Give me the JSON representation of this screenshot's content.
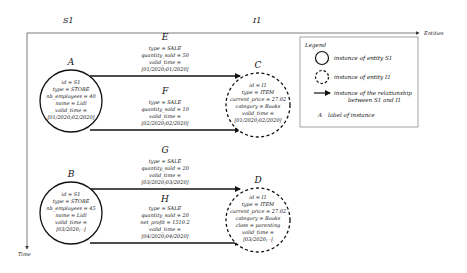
{
  "axes": {
    "x_label": "Entities",
    "y_label": "Time",
    "columns": [
      "S1",
      "I1"
    ]
  },
  "nodes": [
    {
      "label": "A",
      "kind": "S1",
      "attrs": [
        "id = S1",
        "type = STORE",
        "nb_employees = 40",
        "name = Lidl",
        "valid_time =",
        "[01/2020;02/2020]"
      ]
    },
    {
      "label": "B",
      "kind": "S1",
      "attrs": [
        "id = S1",
        "type = STORE",
        "nb_employees = 45",
        "name = Lidl",
        "valid_time =",
        "[03/2020; -]"
      ]
    },
    {
      "label": "C",
      "kind": "I1",
      "attrs": [
        "id = I1",
        "type = ITEM",
        "current_price = 27.02",
        "category = Books",
        "valid_time =",
        "[01/2020;02/2020]"
      ]
    },
    {
      "label": "D",
      "kind": "I1",
      "attrs": [
        "id = I1",
        "type = ITEM",
        "current_price = 27.02",
        "category = Books",
        "class = parenting",
        "valid_time =",
        "[03/2020; -]"
      ]
    }
  ],
  "relationships": [
    {
      "label": "E",
      "from": "A",
      "to": "C",
      "attrs": [
        "type = SALE",
        "quantity_sold = 50",
        "valid_time =",
        "[01/2020;01/2020]"
      ]
    },
    {
      "label": "F",
      "from": "A",
      "to": "C",
      "attrs": [
        "type = SALE",
        "quantity_sold = 10",
        "valid_time =",
        "[02/2020;02/2020]"
      ]
    },
    {
      "label": "G",
      "from": "B",
      "to": "D",
      "attrs": [
        "type = SALE",
        "quantity_sold = 20",
        "valid_time =",
        "[03/2020;03/2020]"
      ]
    },
    {
      "label": "H",
      "from": "B",
      "to": "D",
      "attrs": [
        "type = SALE",
        "quantity_sold = 20",
        "net_profit = 1510.2",
        "valid_time =",
        "[04/2020;04/2020]"
      ]
    }
  ],
  "legend": {
    "title": "Legend",
    "items": [
      {
        "symbol": "solid-circle",
        "text": "instance of entity S1"
      },
      {
        "symbol": "dashed-circle",
        "text": "instance of entity I1"
      },
      {
        "symbol": "arrow",
        "text": "instance of the relationship",
        "text2": "between S1 and I1"
      },
      {
        "symbol": "A",
        "text": "label of instance"
      }
    ]
  }
}
